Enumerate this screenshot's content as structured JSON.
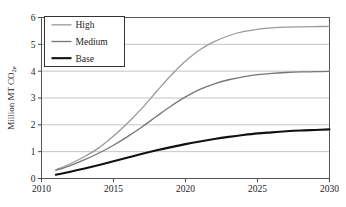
{
  "chart_data": {
    "type": "line",
    "title": "",
    "subtitle": "",
    "xlabel": "",
    "ylabel": "Million MT CO2e",
    "ylabel_main": "Million MT CO",
    "ylabel_sub": "2e",
    "xlim": [
      2010,
      2030
    ],
    "ylim": [
      0,
      6
    ],
    "xticks": [
      "2010",
      "2015",
      "2020",
      "2025",
      "2030"
    ],
    "xtick_values": [
      2010,
      2015,
      2020,
      2025,
      2030
    ],
    "yticks": [
      "0",
      "1",
      "2",
      "3",
      "4",
      "5",
      "6"
    ],
    "ytick_values": [
      0,
      1,
      2,
      3,
      4,
      5,
      6
    ],
    "grid": true,
    "grid_axis": "y",
    "legend_position": "top-left-inside",
    "x": [
      2011,
      2012,
      2013,
      2014,
      2015,
      2016,
      2017,
      2018,
      2019,
      2020,
      2021,
      2022,
      2023,
      2024,
      2025,
      2026,
      2027,
      2028,
      2029,
      2030
    ],
    "series": [
      {
        "name": "High",
        "color": "#9a9a9a",
        "width": 1.3,
        "values": [
          0.32,
          0.55,
          0.82,
          1.15,
          1.58,
          2.08,
          2.63,
          3.25,
          3.85,
          4.38,
          4.8,
          5.1,
          5.32,
          5.47,
          5.56,
          5.61,
          5.64,
          5.65,
          5.66,
          5.67
        ]
      },
      {
        "name": "Medium",
        "color": "#767676",
        "width": 1.3,
        "values": [
          0.3,
          0.48,
          0.7,
          0.95,
          1.24,
          1.57,
          1.93,
          2.32,
          2.7,
          3.04,
          3.32,
          3.53,
          3.68,
          3.79,
          3.87,
          3.92,
          3.95,
          3.97,
          3.98,
          3.99
        ]
      },
      {
        "name": "Base",
        "color": "#111111",
        "width": 2.1,
        "values": [
          0.14,
          0.25,
          0.37,
          0.5,
          0.64,
          0.78,
          0.92,
          1.05,
          1.17,
          1.28,
          1.38,
          1.47,
          1.55,
          1.62,
          1.68,
          1.72,
          1.76,
          1.79,
          1.81,
          1.83
        ]
      }
    ],
    "legend_entries": [
      {
        "label": "High",
        "color": "#9a9a9a"
      },
      {
        "label": "Medium",
        "color": "#767676"
      },
      {
        "label": "Base",
        "color": "#111111"
      }
    ]
  },
  "colors": {
    "axis": "#444444",
    "grid": "#b5b5b5",
    "plot_border": "#555555",
    "background": "#ffffff",
    "legend_border": "#333333"
  }
}
